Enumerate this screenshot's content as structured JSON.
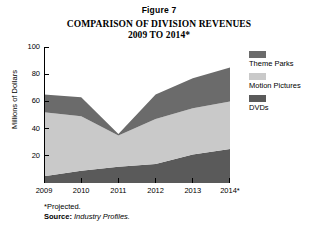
{
  "figure_label": "Figure 7",
  "title_line1": "COMPARISON OF DIVISION REVENUES",
  "title_line2": "2009 TO 2014*",
  "y_axis": {
    "title": "Millions of Dollars",
    "ticks": [
      "100",
      "80",
      "60",
      "40",
      "20"
    ]
  },
  "legend": {
    "items": [
      {
        "label": "Theme Parks",
        "color": "#6b6b6b"
      },
      {
        "label": "Motion Pictures",
        "color": "#c9c9c9"
      },
      {
        "label": "DVDs",
        "color": "#5a5a5a"
      }
    ]
  },
  "footnote": {
    "projected": "*Projected.",
    "source_label": "Source:",
    "source_value": "Industry Profiles."
  },
  "chart_data": {
    "type": "area",
    "stacked": true,
    "title": "COMPARISON OF DIVISION REVENUES 2009 TO 2014*",
    "xlabel": "",
    "ylabel": "Millions of Dollars",
    "ylim": [
      0,
      100
    ],
    "xlim": [
      "2009",
      "2014*"
    ],
    "grid": false,
    "legend_position": "right",
    "categories": [
      "2009",
      "2010",
      "2011",
      "2012",
      "2013",
      "2014*"
    ],
    "series": [
      {
        "name": "DVDs",
        "color": "#5a5a5a",
        "values": [
          5,
          9,
          12,
          14,
          21,
          25
        ]
      },
      {
        "name": "Motion Pictures",
        "color": "#c9c9c9",
        "values": [
          47,
          40,
          23,
          33,
          34,
          35
        ]
      },
      {
        "name": "Theme Parks",
        "color": "#6b6b6b",
        "values": [
          13,
          14,
          1,
          18,
          22,
          25
        ]
      }
    ],
    "totals": [
      65,
      63,
      36,
      65,
      77,
      85
    ],
    "annotations": [
      "*Projected.",
      "Source: Industry Profiles."
    ]
  }
}
